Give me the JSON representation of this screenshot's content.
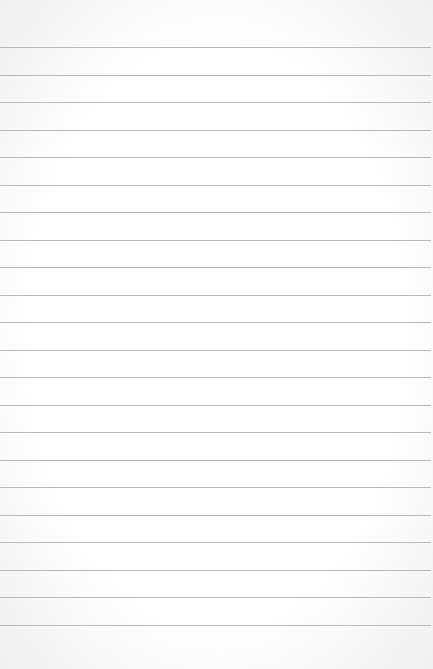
{
  "paper": {
    "type": "lined-notepad",
    "background_color": "#fdfdfd",
    "line_color": "#b9b9b9",
    "line_count": 22,
    "first_line_y": 47,
    "line_spacing": 27.5,
    "lines": []
  }
}
